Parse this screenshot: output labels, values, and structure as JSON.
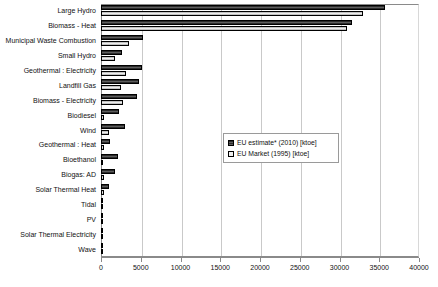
{
  "chart_data": {
    "type": "bar",
    "orientation": "horizontal",
    "title": "",
    "xlabel": "",
    "ylabel": "",
    "xlim": [
      0,
      40000
    ],
    "xticks": [
      0,
      5000,
      10000,
      15000,
      20000,
      25000,
      30000,
      35000,
      40000
    ],
    "xtick_labels": [
      "0",
      "5000",
      "10000",
      "15000",
      "20000",
      "25000",
      "30000",
      "35000",
      "40000"
    ],
    "grid": true,
    "grid_axis": "x",
    "legend_position": "center-right-inside",
    "categories": [
      "Large Hydro",
      "Biomass - Heat",
      "Municipal Waste Combustion",
      "Small Hydro",
      "Geothermal : Electricity",
      "Landfill Gas",
      "Biomass - Electricity",
      "Biodiesel",
      "Wind",
      "Geothermal : Heat",
      "Bioethanol",
      "Biogas: AD",
      "Solar Thermal Heat",
      "Tidal",
      "PV",
      "Solar Thermal Electricity",
      "Wave"
    ],
    "series": [
      {
        "name": "EU estimate* (2010) [ktoe]",
        "color": "#4a4a4a",
        "values": [
          35700,
          31600,
          5300,
          2700,
          5200,
          4800,
          4500,
          2300,
          3000,
          1100,
          2200,
          1800,
          1000,
          300,
          250,
          150,
          200
        ]
      },
      {
        "name": "EU Market (1995) [ktoe]",
        "color": "#d5d5d5",
        "values": [
          33000,
          31000,
          3500,
          1700,
          3100,
          2500,
          2800,
          400,
          1000,
          400,
          300,
          350,
          350,
          120,
          100,
          60,
          60
        ]
      }
    ]
  },
  "legend": {
    "items": [
      {
        "label": "EU estimate* (2010) [ktoe]",
        "swatch": "estimate"
      },
      {
        "label": "EU Market (1995) [ktoe]",
        "swatch": "market"
      }
    ]
  }
}
